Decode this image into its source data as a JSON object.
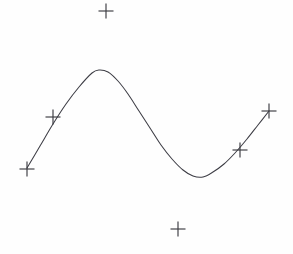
{
  "figure": {
    "background_color": "#fefefe",
    "width": 293,
    "height": 254
  },
  "chart_data": {
    "type": "line",
    "title": "",
    "subtitle": "",
    "xlabel": "",
    "ylabel": "",
    "grid": false,
    "legend": "none",
    "axes_visible": false,
    "tick_labels_x": [],
    "tick_labels_y": [],
    "xlim": [
      0,
      293
    ],
    "ylim": [
      254,
      0
    ],
    "series": [
      {
        "name": "fitted-curve",
        "type": "line",
        "color": "#3c3c44",
        "line_width": 1.05,
        "points": [
          [
            27,
            168
          ],
          [
            40,
            146
          ],
          [
            53,
            124
          ],
          [
            66,
            104
          ],
          [
            79,
            87
          ],
          [
            92,
            73
          ],
          [
            99,
            70
          ],
          [
            108,
            72
          ],
          [
            118,
            81
          ],
          [
            128,
            94
          ],
          [
            139,
            111
          ],
          [
            150,
            128
          ],
          [
            161,
            145
          ],
          [
            172,
            159
          ],
          [
            183,
            170
          ],
          [
            193,
            176
          ],
          [
            203,
            177
          ],
          [
            213,
            172
          ],
          [
            224,
            164
          ],
          [
            235,
            153
          ],
          [
            247,
            139
          ],
          [
            258,
            125
          ],
          [
            269,
            111
          ]
        ]
      },
      {
        "name": "scatter-markers",
        "type": "scatter",
        "marker": "plus",
        "color": "#3a3a40",
        "marker_size": 15,
        "points": [
          {
            "label": "marker-top-outlier",
            "x": 106,
            "y": 11,
            "on_curve": false
          },
          {
            "label": "marker-left-end",
            "x": 27,
            "y": 169,
            "on_curve": true
          },
          {
            "label": "marker-rise-left",
            "x": 53,
            "y": 117,
            "on_curve": true
          },
          {
            "label": "marker-rise-right",
            "x": 240,
            "y": 150,
            "on_curve": true
          },
          {
            "label": "marker-right-end",
            "x": 269,
            "y": 111,
            "on_curve": true
          },
          {
            "label": "marker-bottom-outlier",
            "x": 178,
            "y": 229,
            "on_curve": false
          }
        ]
      }
    ]
  }
}
